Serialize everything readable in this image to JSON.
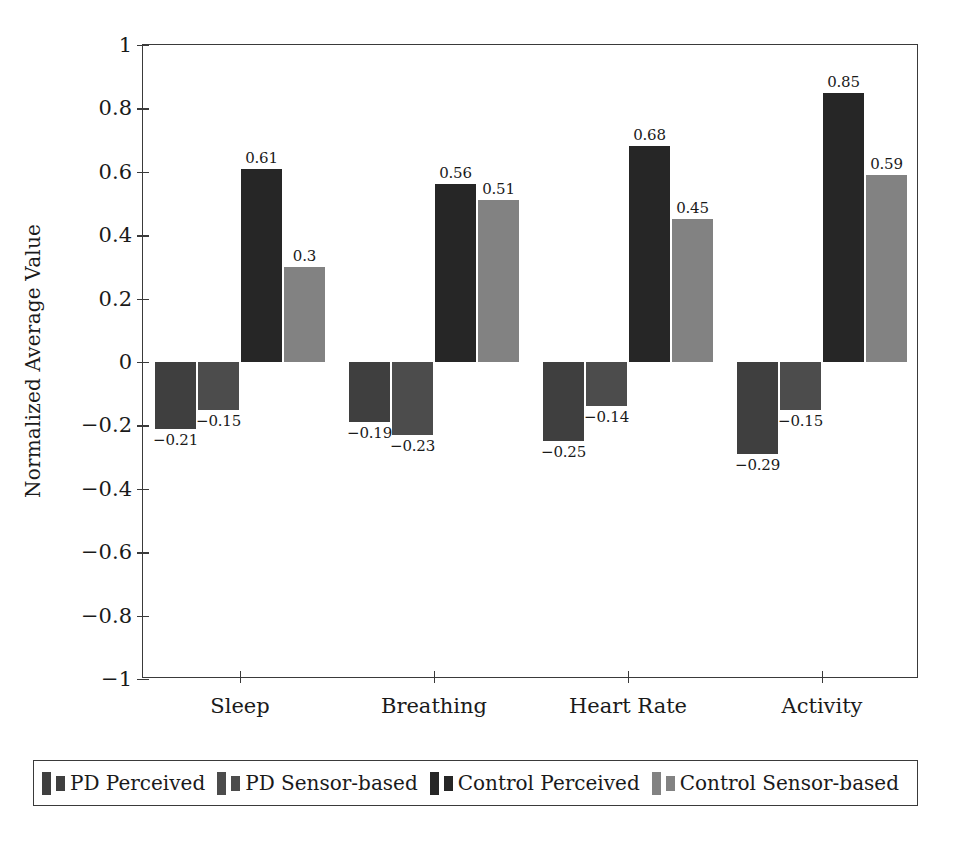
{
  "chart_data": {
    "type": "bar",
    "title": "",
    "subtitle": "",
    "xlabel": "",
    "ylabel": "Normalized Average Value",
    "categories": [
      "Sleep",
      "Breathing",
      "Heart Rate",
      "Activity"
    ],
    "series": [
      {
        "name": "PD Perceived",
        "color": "#3f3f3f",
        "values": [
          -0.21,
          -0.19,
          -0.25,
          -0.29
        ]
      },
      {
        "name": "PD Sensor-based",
        "color": "#4c4c4c",
        "values": [
          -0.15,
          -0.23,
          -0.14,
          -0.15
        ]
      },
      {
        "name": "Control Perceived",
        "color": "#262626",
        "values": [
          0.61,
          0.56,
          0.68,
          0.85
        ]
      },
      {
        "name": "Control Sensor-based",
        "color": "#828282",
        "values": [
          0.3,
          0.51,
          0.45,
          0.59
        ]
      }
    ],
    "value_labels": [
      [
        "-0.21",
        "-0.15",
        "0.61",
        "0.3"
      ],
      [
        "-0.19",
        "-0.23",
        "0.56",
        "0.51"
      ],
      [
        "-0.25",
        "-0.14",
        "0.68",
        "0.45"
      ],
      [
        "-0.29",
        "-0.15",
        "0.85",
        "0.59"
      ]
    ],
    "ylim": [
      -1,
      1
    ],
    "yticks": [
      1,
      0.8,
      0.6,
      0.4,
      0.2,
      0,
      -0.2,
      -0.4,
      -0.6,
      -0.8,
      -1
    ],
    "ytick_labels": [
      "1",
      "0.8",
      "0.6",
      "0.4",
      "0.2",
      "0",
      "-0.2",
      "-0.4",
      "-0.6",
      "-0.8",
      "-1"
    ],
    "grid": false,
    "legend_position": "below",
    "axis_color": "#3a3a3a",
    "background": "#ffffff"
  },
  "legend": {
    "entries": [
      {
        "label": "PD Perceived"
      },
      {
        "label": "PD Sensor-based"
      },
      {
        "label": "Control Perceived"
      },
      {
        "label": "Control Sensor-based"
      }
    ]
  }
}
